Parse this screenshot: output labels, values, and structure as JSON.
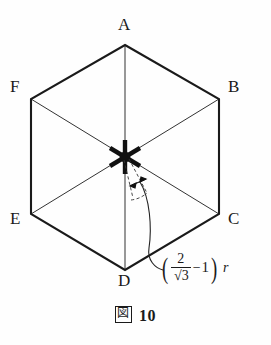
{
  "figure": {
    "caption_symbol": "図",
    "caption_number": "10",
    "stroke_color": "#1a1a1a",
    "background_color": "#fefefe"
  },
  "vertices": [
    {
      "label": "A",
      "x": 125,
      "y": 45
    },
    {
      "label": "B",
      "x": 219,
      "y": 99
    },
    {
      "label": "C",
      "x": 219,
      "y": 214
    },
    {
      "label": "D",
      "x": 125,
      "y": 270
    },
    {
      "label": "E",
      "x": 31,
      "y": 214
    },
    {
      "label": "F",
      "x": 31,
      "y": 99
    }
  ],
  "center": {
    "x": 125,
    "y": 157,
    "marker": "six-pointed-star"
  },
  "annotation": {
    "numerator": "2",
    "radical_sign": "√",
    "denominator": "3",
    "minus": "−",
    "one": "1",
    "variable": "r",
    "left_paren": "(",
    "right_paren": ")"
  }
}
